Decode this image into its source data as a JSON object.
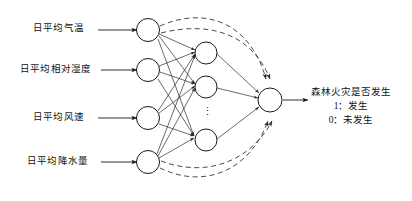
{
  "diagram": {
    "type": "neural-network-topology",
    "colors": {
      "background": "#ffffff",
      "stroke": "#1a1a1a",
      "text": "#111111",
      "dashed_stroke": "#2b2b2b"
    },
    "layers": {
      "input": {
        "name": "input-layer",
        "node_count": 4,
        "nodes": [
          {
            "label": "日平均气温"
          },
          {
            "label": "日平均相对湿度"
          },
          {
            "label": "日平均风速"
          },
          {
            "label": "日平均降水量"
          }
        ]
      },
      "hidden": {
        "name": "hidden-layer",
        "visible_node_count": 3,
        "continuation_marker": "⋮"
      },
      "output": {
        "name": "output-layer",
        "node_count": 1,
        "label_lines": [
          "森林火灾是否发生",
          "1：发生",
          "0：未发生"
        ]
      }
    },
    "connections": {
      "input_to_hidden": "fully-connected-solid-arrows",
      "hidden_to_output": "solid-arrows",
      "feedback": "dashed-curved-arcs-to-output"
    }
  }
}
